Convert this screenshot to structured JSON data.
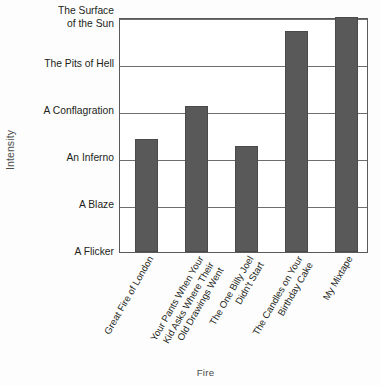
{
  "chart_data": {
    "type": "bar",
    "title": "",
    "xlabel": "Fire",
    "ylabel": "Intensity",
    "grid": true,
    "legend": false,
    "orientation": "vertical",
    "categories": [
      "Great Fire of London",
      "Your Pants When Your Kid Asks Where Their Old Drawings Went",
      "The One Billy Joel Didn't Start",
      "The Candles on Your Birthday Cake",
      "My Mixtape"
    ],
    "category_lines": [
      [
        "Great Fire of London"
      ],
      [
        "Your Pants When Your",
        "Kid Asks Where Their",
        "Old Drawings Went"
      ],
      [
        "The One Billy Joel",
        "Didn't Start"
      ],
      [
        "The Candles on Your",
        "Birthday Cake"
      ],
      [
        "My Mixtape"
      ]
    ],
    "y_tick_labels": [
      "A Flicker",
      "A Blaze",
      "An Inferno",
      "A Conflagration",
      "The Pits of Hell",
      "The Surface of the Sun"
    ],
    "y_tick_label_lines": [
      [
        "A Flicker"
      ],
      [
        "A Blaze"
      ],
      [
        "An Inferno"
      ],
      [
        "A Conflagration"
      ],
      [
        "The Pits of Hell"
      ],
      [
        "The Surface",
        "of the Sun"
      ]
    ],
    "y_tick_values": [
      0,
      1,
      2,
      3,
      4,
      5
    ],
    "ylim": [
      0,
      5
    ],
    "values": [
      2.4,
      3.1,
      2.25,
      4.7,
      5.0
    ],
    "bar_color": "#595959",
    "bar_edge_color": "#4a4a4a",
    "plot_border_color": "#5a5a5a",
    "gridline_color": "#6e6e6e",
    "background_color": "#fdfdfd",
    "text_color": "#231f20",
    "axis_title_color": "#4c4c4c"
  }
}
